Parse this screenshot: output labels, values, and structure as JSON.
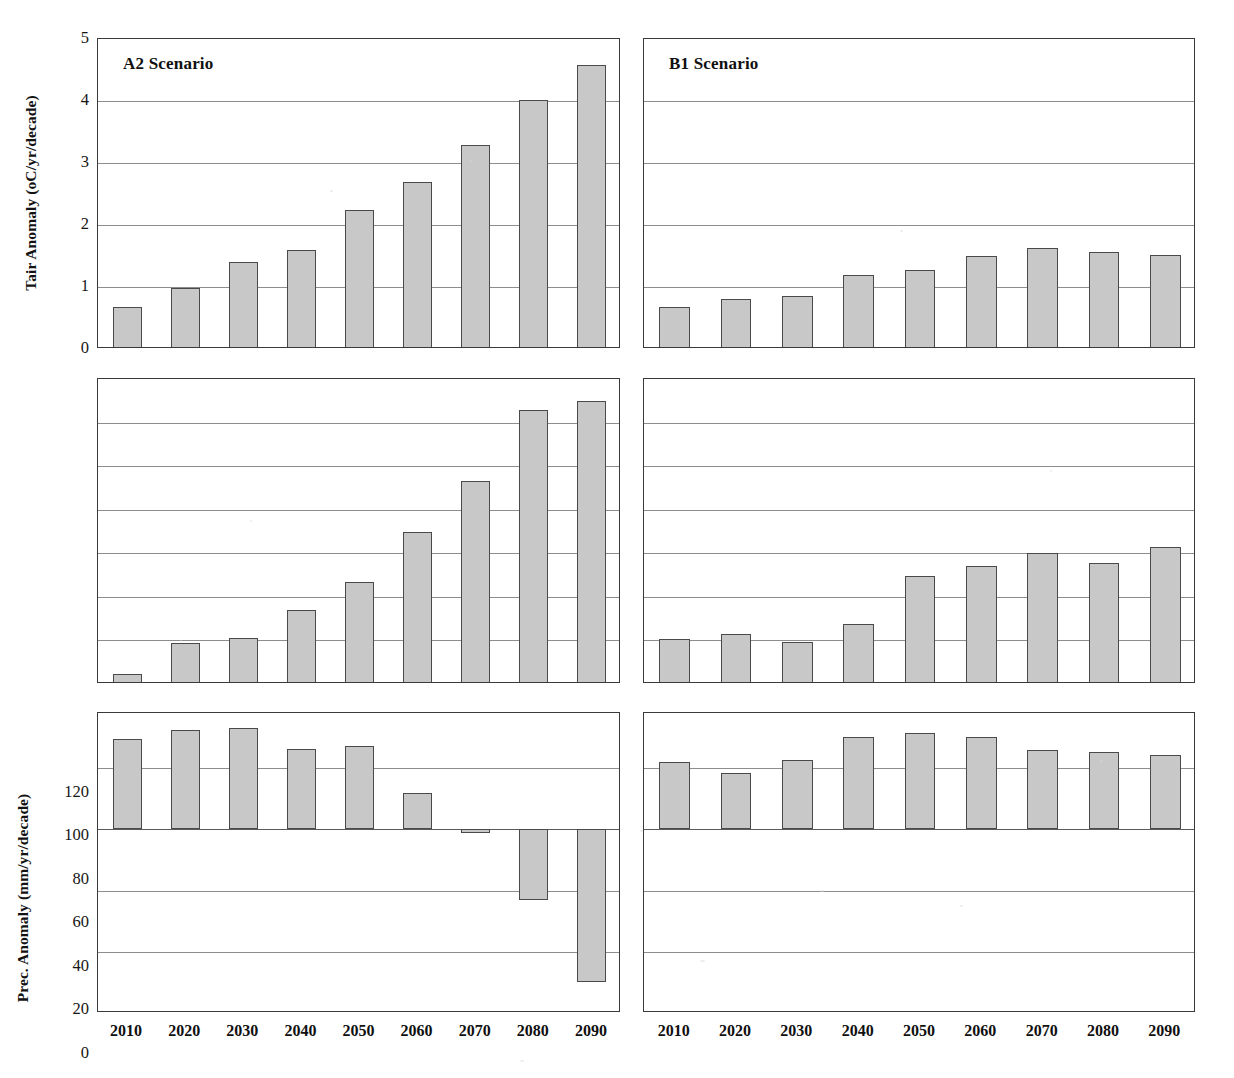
{
  "figure": {
    "bar_fill_color": "#c8c8c8",
    "bar_edge_color": "#4a4a4a",
    "grid_color": "#8d8d8d",
    "axis_color": "#3a3a3a",
    "background_color": "#ffffff"
  },
  "columns": [
    {
      "key": "a2",
      "scenario_label": "A2 Scenario"
    },
    {
      "key": "b1",
      "scenario_label": "B1 Scenario"
    }
  ],
  "x_axis": {
    "label": "",
    "categories": [
      "2010",
      "2020",
      "2030",
      "2040",
      "2050",
      "2060",
      "2070",
      "2080",
      "2090"
    ]
  },
  "rows": [
    {
      "key": "tair",
      "ylabel": "Tair Anomaly (oC/yr/decade)",
      "yticks": [
        "0",
        "1",
        "2",
        "3",
        "4",
        "5"
      ]
    },
    {
      "key": "prec",
      "ylabel": "Prec. Anomaly (mm/yr/decade)",
      "yticks": [
        "0",
        "20",
        "40",
        "60",
        "80",
        "100",
        "120"
      ]
    },
    {
      "key": "npp",
      "ylabel": "NPP Anomaly (PgC/yr/decade)",
      "yticks": [
        "-3",
        "-2",
        "-1",
        "0",
        "1"
      ]
    }
  ],
  "chart_data": [
    {
      "type": "bar",
      "id": "tair-a2",
      "title": "A2 Scenario",
      "xlabel": "",
      "ylabel": "Tair Anomaly (oC/yr/decade)",
      "categories": [
        "2010",
        "2020",
        "2030",
        "2040",
        "2050",
        "2060",
        "2070",
        "2080",
        "2090"
      ],
      "values": [
        0.67,
        0.99,
        1.41,
        1.59,
        2.25,
        2.69,
        3.29,
        4.02,
        4.58
      ],
      "ylim": [
        0,
        5
      ],
      "yticks": [
        0,
        1,
        2,
        3,
        4,
        5
      ],
      "grid": true,
      "legend": "none"
    },
    {
      "type": "bar",
      "id": "tair-b1",
      "title": "B1 Scenario",
      "xlabel": "",
      "ylabel": "Tair Anomaly (oC/yr/decade)",
      "categories": [
        "2010",
        "2020",
        "2030",
        "2040",
        "2050",
        "2060",
        "2070",
        "2080",
        "2090"
      ],
      "values": [
        0.68,
        0.81,
        0.86,
        1.2,
        1.28,
        1.5,
        1.63,
        1.57,
        1.52
      ],
      "ylim": [
        0,
        5
      ],
      "yticks": [
        0,
        1,
        2,
        3,
        4,
        5
      ],
      "grid": true,
      "legend": "none"
    },
    {
      "type": "bar",
      "id": "prec-a2",
      "title": "A2 Scenario",
      "xlabel": "",
      "ylabel": "Prec. Anomaly (mm/yr/decade)",
      "categories": [
        "2010",
        "2020",
        "2030",
        "2040",
        "2050",
        "2060",
        "2070",
        "2080",
        "2090"
      ],
      "values": [
        4.5,
        19.0,
        21.0,
        34.0,
        47.0,
        70.0,
        93.0,
        126.0,
        130.0
      ],
      "ylim": [
        0,
        140
      ],
      "yticks": [
        0,
        20,
        40,
        60,
        80,
        100,
        120
      ],
      "grid": true,
      "legend": "none"
    },
    {
      "type": "bar",
      "id": "prec-b1",
      "title": "B1 Scenario",
      "xlabel": "",
      "ylabel": "Prec. Anomaly (mm/yr/decade)",
      "categories": [
        "2010",
        "2020",
        "2030",
        "2040",
        "2050",
        "2060",
        "2070",
        "2080",
        "2090"
      ],
      "values": [
        20.5,
        23.0,
        19.5,
        27.5,
        49.5,
        54.0,
        60.0,
        55.5,
        63.0
      ],
      "ylim": [
        0,
        140
      ],
      "yticks": [
        0,
        20,
        40,
        60,
        80,
        100,
        120
      ],
      "grid": true,
      "legend": "none"
    },
    {
      "type": "bar",
      "id": "npp-a2",
      "title": "A2 Scenario",
      "xlabel": "",
      "ylabel": "NPP Anomaly (PgC/yr/decade)",
      "categories": [
        "2010",
        "2020",
        "2030",
        "2040",
        "2050",
        "2060",
        "2070",
        "2080",
        "2090"
      ],
      "values": [
        1.48,
        1.62,
        1.65,
        1.32,
        1.36,
        0.6,
        -0.06,
        -1.15,
        -2.5
      ],
      "ylim": [
        -3,
        1.9
      ],
      "yticks": [
        -3,
        -2,
        -1,
        0,
        1
      ],
      "grid": true,
      "legend": "none"
    },
    {
      "type": "bar",
      "id": "npp-b1",
      "title": "B1 Scenario",
      "xlabel": "",
      "ylabel": "NPP Anomaly (PgC/yr/decade)",
      "categories": [
        "2010",
        "2020",
        "2030",
        "2040",
        "2050",
        "2060",
        "2070",
        "2080",
        "2090"
      ],
      "values": [
        1.1,
        0.92,
        1.13,
        1.51,
        1.57,
        1.5,
        1.3,
        1.26,
        1.22
      ],
      "ylim": [
        -3,
        1.9
      ],
      "yticks": [
        -3,
        -2,
        -1,
        0,
        1
      ],
      "grid": true,
      "legend": "none"
    }
  ]
}
